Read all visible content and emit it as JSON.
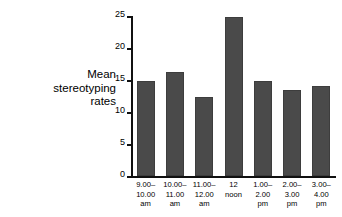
{
  "chart_data": {
    "type": "bar",
    "title": "",
    "xlabel": "",
    "ylabel": "Mean stereotyping rates",
    "ylabel_lines": [
      "Mean",
      "stereotyping",
      "rates"
    ],
    "categories": [
      "9.00–10.00 am",
      "10.00–11.00 am",
      "11.00–12.00 am",
      "12 noon",
      "1.00–2.00 pm",
      "2.00–3.00 pm",
      "3.00–4.00 pm"
    ],
    "category_lines": [
      [
        "9.00–",
        "10.00",
        "am"
      ],
      [
        "10.00–",
        "11.00",
        "am"
      ],
      [
        "11.00–",
        "12.00",
        "am"
      ],
      [
        "12",
        "noon",
        ""
      ],
      [
        "1.00–",
        "2.00",
        "pm"
      ],
      [
        "2.00–",
        "3.00",
        "pm"
      ],
      [
        "3.00–",
        "4.00",
        "pm"
      ]
    ],
    "values": [
      14.9,
      16.3,
      12.4,
      24.9,
      14.9,
      13.4,
      14.0
    ],
    "ylim": [
      0,
      25
    ],
    "yticks": [
      0,
      5,
      10,
      15,
      20,
      25
    ],
    "ytick_labels": [
      "0",
      "5",
      "10",
      "15",
      "20",
      "25"
    ],
    "grid": false,
    "legend": "none",
    "bar_color": "#4a4a4a",
    "axis_color": "#111111",
    "background_color": "#ffffff"
  }
}
